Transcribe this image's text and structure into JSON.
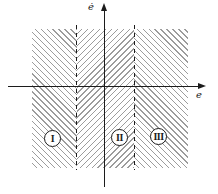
{
  "diagram": {
    "axes": {
      "vertical_label": "ė",
      "horizontal_label": "e"
    },
    "regions": [
      {
        "numeral": "I"
      },
      {
        "numeral": "II"
      },
      {
        "numeral": "III"
      }
    ],
    "colors": {
      "background": "#ffffff",
      "hatch": "#9c9c9c",
      "line": "#1c1c1c"
    }
  }
}
